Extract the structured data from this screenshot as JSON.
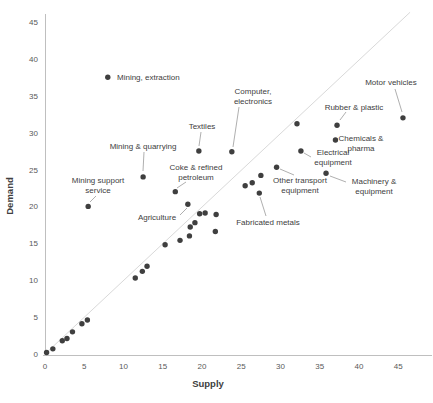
{
  "chart_data": {
    "type": "scatter",
    "title": "",
    "xlabel": "Supply",
    "ylabel": "Demand",
    "xlim": [
      0,
      45
    ],
    "ylim": [
      0,
      45
    ],
    "xticks": [
      0,
      5,
      10,
      15,
      20,
      25,
      30,
      35,
      40,
      45
    ],
    "yticks": [
      0,
      5,
      10,
      15,
      20,
      25,
      30,
      35,
      40,
      45
    ],
    "grid": false,
    "legend": null,
    "reference_line": {
      "from": [
        0,
        0
      ],
      "to": [
        46.5,
        46.3
      ],
      "meaning": "identity y = x"
    },
    "points": [
      {
        "label": "Mining, extraction",
        "x": 8,
        "y": 37.5,
        "lines": [
          "Mining, extraction"
        ],
        "lx": 117,
        "ly": 80,
        "anchor": "start",
        "leader": null
      },
      {
        "label": "Mining & quarrying",
        "x": 12.5,
        "y": 24,
        "lines": [
          "Mining & quarrying"
        ],
        "lx": 143,
        "ly": 149,
        "anchor": "middle",
        "leader": [
          144,
          152,
          143,
          171
        ]
      },
      {
        "label": "Mining support service",
        "x": 5.5,
        "y": 20,
        "lines": [
          "Mining support",
          "service"
        ],
        "lx": 98,
        "ly": 183,
        "anchor": "middle",
        "leader": [
          96,
          196,
          90,
          202
        ]
      },
      {
        "label": "Textiles",
        "x": 19.6,
        "y": 27.5,
        "lines": [
          "Textiles"
        ],
        "lx": 202,
        "ly": 129,
        "anchor": "middle",
        "leader": [
          201,
          132,
          199,
          146
        ]
      },
      {
        "label": "Computer, electronics",
        "x": 23.8,
        "y": 27.4,
        "lines": [
          "Computer,",
          "electronics"
        ],
        "lx": 253,
        "ly": 94,
        "anchor": "middle",
        "leader": [
          239,
          107,
          233,
          147
        ]
      },
      {
        "label": "Coke & refined petroleum",
        "x": 16.6,
        "y": 22,
        "lines": [
          "Coke & refined",
          "petroleum"
        ],
        "lx": 196,
        "ly": 170,
        "anchor": "middle",
        "leader": [
          186,
          182,
          177,
          188
        ]
      },
      {
        "label": "Agriculture",
        "x": 18.2,
        "y": 20.3,
        "lines": [
          "Agriculture"
        ],
        "lx": 157,
        "ly": 220,
        "anchor": "middle",
        "leader": [
          180,
          215,
          187,
          208
        ]
      },
      {
        "label": "Fabricated metals",
        "x": 27.3,
        "y": 21.8,
        "lines": [
          "Fabricated metals"
        ],
        "lx": 268,
        "ly": 225,
        "anchor": "middle",
        "leader": [
          266,
          216,
          260,
          197
        ]
      },
      {
        "label": "Other transport equipment",
        "x": 29.5,
        "y": 25.3,
        "lines": [
          "Other transport",
          "equipment"
        ],
        "lx": 300,
        "ly": 183,
        "anchor": "middle",
        "leader": [
          294,
          175,
          280,
          169
        ]
      },
      {
        "label": "Electrical equipment",
        "x": 32.6,
        "y": 27.5,
        "lines": [
          "Electrical",
          "equipment"
        ],
        "lx": 333,
        "ly": 155,
        "anchor": "middle",
        "leader": [
          311,
          157,
          304,
          153
        ]
      },
      {
        "label": "Machinery & equipment",
        "x": 35.8,
        "y": 24.5,
        "lines": [
          "Machinery &",
          "equipment"
        ],
        "lx": 374,
        "ly": 184,
        "anchor": "middle",
        "leader": [
          346,
          182,
          330,
          176
        ]
      },
      {
        "label": "Chemicals & pharma",
        "x": 37,
        "y": 29,
        "lines": [
          "Chemicals &",
          "pharma"
        ],
        "lx": 361,
        "ly": 141,
        "anchor": "middle",
        "leader": null
      },
      {
        "label": "Rubber & plastic",
        "x": 37.2,
        "y": 31,
        "lines": [
          "Rubber & plastic"
        ],
        "lx": 354,
        "ly": 110,
        "anchor": "middle",
        "leader": [
          346,
          112,
          340,
          120
        ]
      },
      {
        "label": "Motor vehicles",
        "x": 45.6,
        "y": 32,
        "lines": [
          "Motor vehicles"
        ],
        "lx": 391,
        "ly": 85,
        "anchor": "middle",
        "leader": [
          395,
          89,
          402,
          112
        ]
      }
    ],
    "unlabeled_points": [
      [
        0.2,
        0.2
      ],
      [
        1,
        0.7
      ],
      [
        2.2,
        1.8
      ],
      [
        2.8,
        2.1
      ],
      [
        3.5,
        3
      ],
      [
        4.7,
        4.1
      ],
      [
        5.4,
        4.6
      ],
      [
        11.5,
        10.3
      ],
      [
        12.4,
        11.2
      ],
      [
        13,
        11.9
      ],
      [
        15.3,
        14.8
      ],
      [
        17.2,
        15.4
      ],
      [
        18.4,
        16
      ],
      [
        18.5,
        17.2
      ],
      [
        19.1,
        17.8
      ],
      [
        21.7,
        16.6
      ],
      [
        19.7,
        19
      ],
      [
        20.4,
        19.1
      ],
      [
        21.8,
        18.9
      ],
      [
        25.5,
        22.8
      ],
      [
        26.4,
        23.2
      ],
      [
        27.5,
        24.2
      ],
      [
        32.1,
        31.2
      ]
    ],
    "colors": {
      "dot": "#3f3f3f",
      "tick_text": "#595959",
      "axis_line": "#bfbfbf",
      "annotation_text": "#404040",
      "leader_line": "#a6a6a6",
      "reference_line": "#d9d9d9",
      "background": "#ffffff"
    }
  }
}
